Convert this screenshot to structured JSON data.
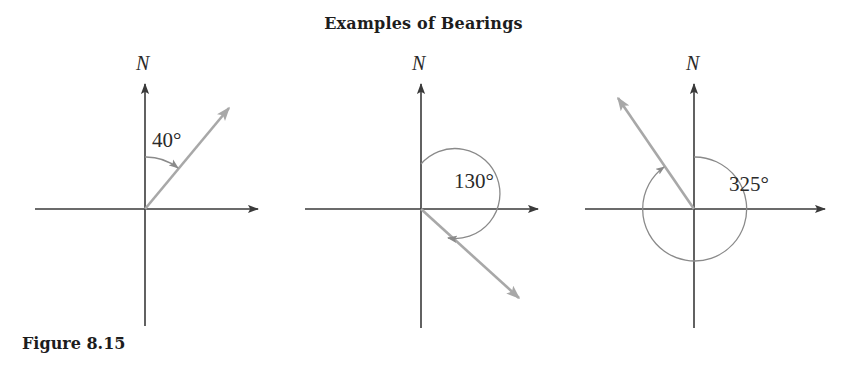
{
  "figure": {
    "title": "Examples of Bearings",
    "caption": "Figure 8.15",
    "axis_color": "#3a3a3a",
    "bearing_color": "#a8a8a8",
    "arc_color": "#8a8a8a",
    "text_color": "#1d1d1d"
  },
  "diagrams": [
    {
      "id": "bearing-40",
      "north_label": "N",
      "angle_label": "40°",
      "bearing_degrees": 40,
      "origin": {
        "x": 145,
        "y": 209
      },
      "north_label_pos": {
        "x": 136,
        "y": 52
      },
      "angle_label_pos": {
        "x": 152,
        "y": 128
      },
      "vertical_axis": {
        "top": 84,
        "bottom": 326
      },
      "horizontal_axis": {
        "left": 35,
        "right": 258
      },
      "bearing_arrow_tip": {
        "x": 229,
        "y": 108
      },
      "arc_radius": 52
    },
    {
      "id": "bearing-130",
      "north_label": "N",
      "angle_label": "130°",
      "bearing_degrees": 130,
      "origin": {
        "x": 421,
        "y": 209
      },
      "north_label_pos": {
        "x": 412,
        "y": 52
      },
      "angle_label_pos": {
        "x": 454,
        "y": 169
      },
      "vertical_axis": {
        "top": 84,
        "bottom": 328
      },
      "horizontal_axis": {
        "left": 305,
        "right": 538
      },
      "bearing_arrow_tip": {
        "x": 519,
        "y": 298
      },
      "arc_radius": 45
    },
    {
      "id": "bearing-325",
      "north_label": "N",
      "angle_label": "325°",
      "bearing_degrees": 325,
      "origin": {
        "x": 694,
        "y": 209
      },
      "north_label_pos": {
        "x": 686,
        "y": 52
      },
      "angle_label_pos": {
        "x": 729,
        "y": 172
      },
      "vertical_axis": {
        "top": 84,
        "bottom": 328
      },
      "horizontal_axis": {
        "left": 585,
        "right": 825
      },
      "bearing_arrow_tip": {
        "x": 618,
        "y": 98
      },
      "arc_radius": 52
    }
  ]
}
